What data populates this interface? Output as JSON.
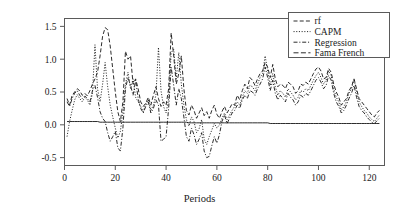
{
  "chart_data": {
    "type": "line",
    "title": "",
    "xlabel": "Periods",
    "ylabel": "Observed returns",
    "xlim": [
      0,
      126
    ],
    "ylim": [
      -0.62,
      1.62
    ],
    "xticks": [
      0,
      20,
      40,
      60,
      80,
      100,
      120
    ],
    "xtick_labels": [
      "0",
      "20",
      "40",
      "60",
      "80",
      "100",
      "120"
    ],
    "yticks": [
      -0.5,
      0.0,
      0.5,
      1.0,
      1.5
    ],
    "ytick_labels": [
      "-0.5",
      "0.0",
      "0.5",
      "1.0",
      "1.5"
    ],
    "grid": false,
    "legend_position": "top-right",
    "legend_entries": [
      "rf",
      "CAPM",
      "Regression",
      "Fama French"
    ],
    "x": [
      1,
      2,
      3,
      4,
      5,
      6,
      7,
      8,
      9,
      10,
      11,
      12,
      13,
      14,
      15,
      16,
      17,
      18,
      19,
      20,
      21,
      22,
      23,
      24,
      25,
      26,
      27,
      28,
      29,
      30,
      31,
      32,
      33,
      34,
      35,
      36,
      37,
      38,
      39,
      40,
      41,
      42,
      43,
      44,
      45,
      46,
      47,
      48,
      49,
      50,
      51,
      52,
      53,
      54,
      55,
      56,
      57,
      58,
      59,
      60,
      61,
      62,
      63,
      64,
      65,
      66,
      67,
      68,
      69,
      70,
      71,
      72,
      73,
      74,
      75,
      76,
      77,
      78,
      79,
      80,
      81,
      82,
      83,
      84,
      85,
      86,
      87,
      88,
      89,
      90,
      91,
      92,
      93,
      94,
      95,
      96,
      97,
      98,
      99,
      100,
      101,
      102,
      103,
      104,
      105,
      106,
      107,
      108,
      109,
      110,
      111,
      112,
      113,
      114,
      115,
      116,
      117,
      118,
      119,
      120,
      121,
      122,
      123,
      124
    ],
    "series": [
      {
        "name": "rf",
        "dash": "dashed",
        "values": [
          0.4,
          0.3,
          0.45,
          0.5,
          0.55,
          0.52,
          0.45,
          0.48,
          0.44,
          0.52,
          0.62,
          0.7,
          0.8,
          1.05,
          1.35,
          1.48,
          1.45,
          1.2,
          0.85,
          0.5,
          0.2,
          0.05,
          0.35,
          1.12,
          1.0,
          1.05,
          0.62,
          0.7,
          0.55,
          0.35,
          0.28,
          0.33,
          0.42,
          0.3,
          0.45,
          0.58,
          0.4,
          0.28,
          0.35,
          0.3,
          0.55,
          1.4,
          1.05,
          0.62,
          0.78,
          1.05,
          0.55,
          0.22,
          0.15,
          0.3,
          0.22,
          0.1,
          0.18,
          0.26,
          0.14,
          0.2,
          0.1,
          0.22,
          0.3,
          0.16,
          0.1,
          0.2,
          0.28,
          0.18,
          0.25,
          0.32,
          0.3,
          0.45,
          0.38,
          0.52,
          0.62,
          0.55,
          0.72,
          0.68,
          0.6,
          0.7,
          0.78,
          0.82,
          0.95,
          0.88,
          0.72,
          0.92,
          0.7,
          0.58,
          0.62,
          0.6,
          0.55,
          0.65,
          0.62,
          0.58,
          0.48,
          0.52,
          0.62,
          0.6,
          0.65,
          0.62,
          0.7,
          0.78,
          0.85,
          0.88,
          0.82,
          0.7,
          0.72,
          0.86,
          0.8,
          0.62,
          0.5,
          0.42,
          0.3,
          0.35,
          0.4,
          0.52,
          0.58,
          0.7,
          0.55,
          0.4,
          0.35,
          0.3,
          0.25,
          0.2,
          0.15,
          0.12,
          0.18,
          0.22
        ]
      },
      {
        "name": "CAPM",
        "dash": "dotted",
        "values": [
          -0.18,
          0.05,
          0.22,
          0.38,
          0.46,
          0.4,
          0.35,
          0.42,
          0.38,
          0.3,
          0.48,
          1.22,
          0.55,
          0.35,
          0.62,
          0.95,
          0.58,
          0.3,
          0.12,
          -0.05,
          -0.2,
          -0.1,
          0.2,
          0.62,
          0.8,
          0.55,
          0.7,
          0.42,
          0.35,
          0.28,
          0.2,
          0.32,
          0.38,
          0.22,
          0.3,
          0.45,
          1.18,
          0.52,
          0.28,
          0.18,
          0.4,
          1.1,
          1.15,
          0.7,
          1.1,
          0.62,
          0.3,
          0.08,
          -0.02,
          0.12,
          0.05,
          -0.12,
          -0.06,
          0.08,
          -0.22,
          -0.3,
          -0.18,
          -0.08,
          0.02,
          -0.05,
          0.0,
          0.1,
          0.18,
          0.08,
          0.15,
          0.22,
          0.28,
          0.35,
          0.3,
          0.42,
          0.52,
          0.48,
          0.6,
          0.58,
          0.52,
          0.62,
          0.72,
          0.78,
          1.05,
          0.82,
          0.6,
          0.78,
          0.58,
          0.45,
          0.52,
          0.48,
          0.42,
          0.55,
          0.5,
          0.45,
          0.38,
          0.42,
          0.52,
          0.5,
          0.55,
          0.52,
          0.6,
          0.68,
          0.75,
          0.8,
          0.72,
          0.62,
          0.68,
          0.82,
          0.75,
          0.55,
          0.42,
          0.35,
          0.22,
          0.28,
          0.35,
          0.48,
          0.55,
          0.7,
          0.5,
          0.35,
          0.28,
          0.22,
          0.18,
          0.12,
          0.08,
          0.05,
          0.1,
          0.15
        ]
      },
      {
        "name": "Regression",
        "dash": "dashdot",
        "values": [
          0.35,
          0.28,
          0.4,
          0.48,
          0.52,
          0.45,
          0.4,
          0.44,
          0.4,
          0.35,
          0.52,
          0.6,
          0.42,
          0.2,
          0.1,
          0.05,
          -0.12,
          -0.25,
          -0.18,
          -0.1,
          -0.35,
          -0.4,
          -0.05,
          0.55,
          0.72,
          0.6,
          0.45,
          0.68,
          0.4,
          0.25,
          0.18,
          0.28,
          0.35,
          0.18,
          0.25,
          0.38,
          0.3,
          -0.25,
          -0.22,
          -0.18,
          0.25,
          0.88,
          0.6,
          0.3,
          0.55,
          0.4,
          0.12,
          -0.18,
          -0.25,
          -0.05,
          -0.15,
          -0.3,
          -0.22,
          -0.12,
          -0.4,
          -0.5,
          -0.48,
          -0.32,
          -0.18,
          -0.28,
          -0.15,
          0.05,
          0.15,
          0.02,
          0.1,
          0.18,
          0.22,
          0.3,
          0.25,
          0.38,
          0.45,
          0.4,
          0.52,
          0.5,
          0.45,
          0.55,
          0.62,
          0.7,
          0.88,
          0.72,
          0.52,
          0.68,
          0.48,
          0.38,
          0.45,
          0.4,
          0.35,
          0.48,
          0.42,
          0.38,
          0.3,
          0.35,
          0.45,
          0.42,
          0.48,
          0.45,
          0.52,
          0.6,
          0.68,
          0.72,
          0.65,
          0.55,
          0.6,
          0.75,
          0.68,
          0.48,
          0.35,
          0.28,
          0.18,
          0.22,
          0.3,
          0.4,
          0.48,
          0.6,
          0.42,
          0.28,
          0.22,
          0.18,
          0.12,
          0.08,
          0.04,
          0.02,
          0.06,
          0.1
        ]
      },
      {
        "name": "Fama French",
        "dash": "longdash",
        "values": [
          0.05,
          0.05,
          0.05,
          0.05,
          0.05,
          0.05,
          0.05,
          0.05,
          0.05,
          0.05,
          0.05,
          0.05,
          0.05,
          0.04,
          0.04,
          0.04,
          0.04,
          0.04,
          0.04,
          0.04,
          0.04,
          0.04,
          0.04,
          0.04,
          0.04,
          0.04,
          0.04,
          0.04,
          0.04,
          0.04,
          0.04,
          0.04,
          0.04,
          0.04,
          0.04,
          0.04,
          0.04,
          0.04,
          0.04,
          0.04,
          0.04,
          0.04,
          0.04,
          0.04,
          0.04,
          0.04,
          0.04,
          0.04,
          0.03,
          0.03,
          0.03,
          0.03,
          0.03,
          0.03,
          0.03,
          0.03,
          0.03,
          0.03,
          0.03,
          0.03,
          0.03,
          0.03,
          0.03,
          0.03,
          0.03,
          0.03,
          0.03,
          0.03,
          0.03,
          0.03,
          0.03,
          0.03,
          0.03,
          0.03,
          0.03,
          0.03,
          0.03,
          0.03,
          0.03,
          0.03,
          0.02,
          0.02,
          0.02,
          0.02,
          0.02,
          0.02,
          0.02,
          0.02,
          0.02,
          0.02,
          0.02,
          0.02,
          0.02,
          0.02,
          0.02,
          0.02,
          0.02,
          0.02,
          0.02,
          0.02,
          0.02,
          0.02,
          0.02,
          0.02,
          0.02,
          0.02,
          0.02,
          0.02,
          0.02,
          0.02,
          0.02,
          0.02,
          0.02,
          0.02,
          0.02,
          0.02,
          0.02,
          0.02,
          0.02,
          0.02,
          0.02,
          0.02,
          0.02,
          0.02
        ]
      }
    ],
    "colors": {
      "line": "#141414",
      "axis": "#5a5a5a",
      "background": "#ffffff"
    }
  }
}
